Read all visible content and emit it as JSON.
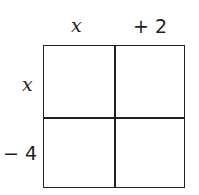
{
  "diagram": {
    "type": "area-model-grid",
    "top_labels": [
      {
        "text": "x",
        "style": "variable"
      },
      {
        "text": "+ 2",
        "style": "number"
      }
    ],
    "side_labels": [
      {
        "text": "x",
        "style": "variable"
      },
      {
        "text": "− 4",
        "style": "number"
      }
    ],
    "rows": 2,
    "cols": 2,
    "cells": [
      [
        "",
        ""
      ],
      [
        "",
        ""
      ]
    ],
    "line_color": "#231f20"
  }
}
